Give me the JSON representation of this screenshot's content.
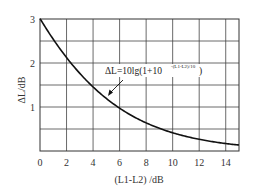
{
  "chart_data": {
    "type": "line",
    "title": "",
    "xlabel": "(L1-L2) /dB",
    "ylabel": "ΔL/dB",
    "xlim": [
      0,
      15
    ],
    "ylim": [
      0,
      3
    ],
    "grid": true,
    "x_ticks": [
      "0",
      "2",
      "4",
      "6",
      "8",
      "10",
      "12",
      "14"
    ],
    "y_ticks": [
      "1",
      "2",
      "3"
    ],
    "series": [
      {
        "name": "ΔL=10lg(1+10^(-(L1-L2)/10))",
        "x": [
          0,
          1,
          2,
          3,
          4,
          5,
          6,
          7,
          8,
          9,
          10,
          11,
          12,
          13,
          14,
          15
        ],
        "values": [
          3.01,
          2.54,
          2.12,
          1.76,
          1.46,
          1.19,
          0.97,
          0.79,
          0.64,
          0.51,
          0.41,
          0.33,
          0.27,
          0.21,
          0.17,
          0.14
        ]
      }
    ],
    "annotation": {
      "text": "ΔL=10lg(1+10",
      "superscript": "-(L1-L2)/10",
      "closing": ")",
      "arrow_target_x": 5.2,
      "arrow_target_y": 1.15
    }
  }
}
